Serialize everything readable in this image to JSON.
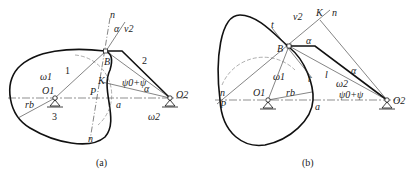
{
  "figure_a": {
    "caption": "(a)",
    "labels": {
      "n_top": "n",
      "alpha": "α",
      "v2": "v2",
      "B": "B",
      "link2": "2",
      "omega1": "ω1",
      "link1": "1",
      "K": "K",
      "psi": "ψ0+ψ",
      "alpha2": "α",
      "O1": "O1",
      "P": "P",
      "a": "a",
      "O2": "O2",
      "rb": "rb",
      "link3": "3",
      "omega2": "ω2",
      "n_bottom": "n"
    }
  },
  "figure_b": {
    "caption": "(b)",
    "labels": {
      "t_top": "t",
      "v2": "v2",
      "K": "K",
      "n_top": "n",
      "alpha": "α",
      "B": "B",
      "omega1": "ω1",
      "t_bottom": "t",
      "l": "l",
      "alpha2": "α",
      "omega2": "ω2",
      "n_left": "n",
      "P": "P",
      "O1": "O1",
      "rb": "rb",
      "a": "a",
      "psi": "ψ0+ψ",
      "O2": "O2"
    }
  },
  "colors": {
    "stroke": "#222222",
    "dashed": "#777777"
  }
}
